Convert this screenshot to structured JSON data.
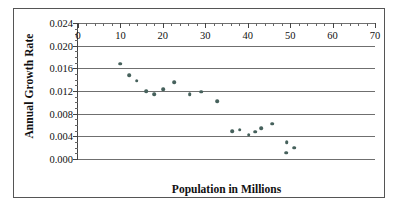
{
  "chart_data": {
    "type": "scatter",
    "title": "",
    "xlabel": "Population in Millions",
    "ylabel": "Annual Growth Rate",
    "xlim": [
      0,
      70
    ],
    "ylim": [
      0.0,
      0.024
    ],
    "xticks": [
      0,
      10,
      20,
      30,
      40,
      50,
      60,
      70
    ],
    "xtick_labels": [
      "0",
      "10",
      "20",
      "30",
      "40",
      "50",
      "60",
      "70"
    ],
    "yticks": [
      0.0,
      0.004,
      0.008,
      0.012,
      0.016,
      0.02,
      0.024
    ],
    "ytick_labels": [
      "0.000",
      "0.004",
      "0.008",
      "0.012",
      "0.016",
      "0.020",
      "0.024"
    ],
    "x_minor_tick_step": 2,
    "y_minor_tick_step": 0.001,
    "grid": "horizontal",
    "legend": null,
    "marker_color": "#46615c",
    "series": [
      {
        "name": "Annual Growth Rate vs Population",
        "points": [
          {
            "x": 10.0,
            "y": 0.0168
          },
          {
            "x": 12.0,
            "y": 0.0148
          },
          {
            "x": 13.8,
            "y": 0.0138
          },
          {
            "x": 16.1,
            "y": 0.012
          },
          {
            "x": 17.9,
            "y": 0.0114
          },
          {
            "x": 20.1,
            "y": 0.0123
          },
          {
            "x": 22.7,
            "y": 0.0136
          },
          {
            "x": 26.3,
            "y": 0.0114
          },
          {
            "x": 29.0,
            "y": 0.0119
          },
          {
            "x": 32.8,
            "y": 0.0102
          },
          {
            "x": 36.4,
            "y": 0.0049
          },
          {
            "x": 38.1,
            "y": 0.0052
          },
          {
            "x": 40.2,
            "y": 0.0043
          },
          {
            "x": 41.7,
            "y": 0.0048
          },
          {
            "x": 43.2,
            "y": 0.0054
          },
          {
            "x": 45.8,
            "y": 0.0062
          },
          {
            "x": 49.2,
            "y": 0.003
          },
          {
            "x": 49.1,
            "y": 0.0011
          },
          {
            "x": 50.9,
            "y": 0.002
          }
        ]
      }
    ]
  }
}
